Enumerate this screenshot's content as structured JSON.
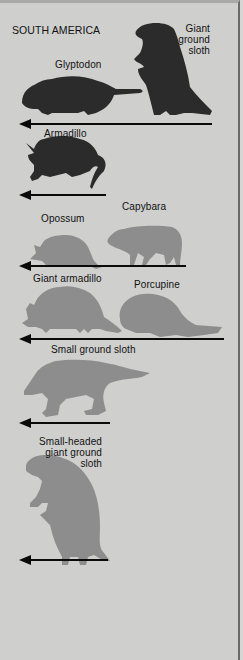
{
  "figure": {
    "region_title": "SOUTH AMERICA",
    "colors": {
      "background": "#cfcfcd",
      "dark_silhouette": "#2b2b2b",
      "light_silhouette": "#8d8d8d",
      "arrow": "#0a0a0a",
      "border": "#6a6a6a"
    },
    "rows": [
      {
        "animals": [
          {
            "name": "Glyptodon",
            "shade": "dark"
          },
          {
            "name": "Giant ground sloth",
            "lines": [
              "Giant",
              "ground",
              "sloth"
            ],
            "shade": "dark"
          }
        ],
        "arrow": "long"
      },
      {
        "animals": [
          {
            "name": "Armadillo",
            "shade": "dark"
          }
        ],
        "arrow": "short"
      },
      {
        "animals": [
          {
            "name": "Opossum",
            "shade": "light"
          },
          {
            "name": "Capybara",
            "shade": "light"
          }
        ],
        "arrow": "long"
      },
      {
        "animals": [
          {
            "name": "Giant armadillo",
            "shade": "light"
          },
          {
            "name": "Porcupine",
            "shade": "light"
          }
        ],
        "arrow": "long"
      },
      {
        "animals": [
          {
            "name": "Small ground sloth",
            "shade": "light"
          }
        ],
        "arrow": "short"
      },
      {
        "animals": [
          {
            "name": "Small-headed giant ground sloth",
            "lines": [
              "Small-headed",
              "giant ground",
              "sloth"
            ],
            "shade": "light"
          }
        ],
        "arrow": "short"
      }
    ]
  }
}
